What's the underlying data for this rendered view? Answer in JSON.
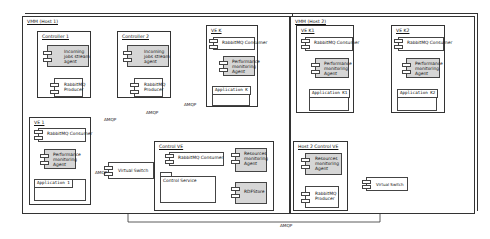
{
  "host1": {
    "title": "VMM (Host 1)",
    "controller1": {
      "title": "Controller 1",
      "agent": "Incoming jobs stream agent",
      "producer": "RabbitMQ Producer"
    },
    "controller2": {
      "title": "Controller 2",
      "agent": "Incoming jobs stream agent",
      "producer": "RabbitMQ Producer"
    },
    "ve1": {
      "title": "VE 1",
      "consumer": "RabbitMQ Consumer",
      "agent": "Performance monitoring Agent",
      "application": "Application 1"
    },
    "vek": {
      "title": "VE K",
      "consumer": "RabbitMQ Consumer",
      "agent": "Performance monitoring Agent",
      "application": "Application K"
    },
    "switch": "Virtual Switch",
    "control_ve": {
      "title": "Control VE",
      "consumer": "RabbitMQ Consumer",
      "service": "Control Service",
      "resource_agent": "Resources monitoring Agent",
      "store": "RDFStore"
    }
  },
  "host2": {
    "title": "VMM (Host 2)",
    "ve_k1": {
      "title": "VE K1",
      "consumer": "RabbitMQ Consumer",
      "agent": "Performance monitoring Agent",
      "application": "Application K1"
    },
    "ve_k2": {
      "title": "VE K2",
      "consumer": "RabbitMQ Consumer",
      "agent": "Performance monitoring Agent",
      "application": "Application K2"
    },
    "control_ve": {
      "title": "Host 2 Control VE",
      "resource_agent": "Resources monitoring Agent",
      "producer": "RabbitMQ Producer"
    },
    "switch": "Virtual Switch"
  },
  "links": {
    "amqp1": "AMQP",
    "amqp2": "AMQP",
    "amqp3": "AMQP",
    "amqp4": "AMQP",
    "amqp_bottom": "AMQP"
  }
}
